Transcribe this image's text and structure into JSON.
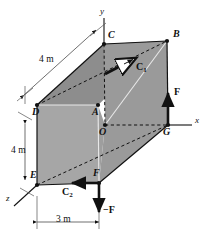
{
  "figure": {
    "type": "statics-free-body-diagram",
    "background_color": "#ffffff",
    "face_fill_front": "#9b9b9b",
    "face_fill_left": "#a8a8a8",
    "face_fill_top": "#8f8f8f",
    "line_color": "#111111"
  },
  "axes": [
    {
      "name": "y-axis",
      "label": "y",
      "x": 101,
      "y": 11
    },
    {
      "name": "x-axis",
      "label": "x",
      "x": 196,
      "y": 119
    },
    {
      "name": "z-axis",
      "label": "z",
      "x": 8,
      "y": 195
    }
  ],
  "vertices": [
    {
      "name": "C",
      "label": "C",
      "px": 104,
      "py": 44,
      "lx": 109,
      "ly": 33
    },
    {
      "name": "B",
      "label": "B",
      "px": 167,
      "py": 41,
      "lx": 174,
      "ly": 33
    },
    {
      "name": "D",
      "label": "D",
      "px": 37,
      "py": 105,
      "lx": 33,
      "ly": 109
    },
    {
      "name": "A",
      "label": "A",
      "px": 98,
      "py": 105,
      "lx": 94,
      "ly": 109
    },
    {
      "name": "O",
      "label": "O",
      "px": 105,
      "py": 125,
      "lx": 100,
      "ly": 129
    },
    {
      "name": "G",
      "label": "G",
      "px": 168,
      "py": 125,
      "lx": 164,
      "ly": 129
    },
    {
      "name": "E",
      "label": "E",
      "px": 37,
      "py": 185,
      "lx": 31,
      "ly": 173
    },
    {
      "name": "F",
      "label": "F",
      "px": 99,
      "py": 183,
      "lx": 95,
      "ly": 171
    }
  ],
  "dimensions": [
    {
      "name": "depth-dimension",
      "label": "4 m",
      "lx": 41,
      "ly": 57
    },
    {
      "name": "height-dimension",
      "label": "4 m",
      "lx": 14,
      "ly": 150
    },
    {
      "name": "width-dimension",
      "label": "3 m",
      "lx": 59,
      "ly": 217
    }
  ],
  "vectors": [
    {
      "name": "couple-C1",
      "label": "C",
      "sub": "1",
      "lx": 138,
      "ly": 64
    },
    {
      "name": "couple-C2",
      "label": "C",
      "sub": "2",
      "lx": 63,
      "ly": 188
    },
    {
      "name": "force-F-up",
      "label": "F",
      "sub": "",
      "lx": 175,
      "ly": 89
    },
    {
      "name": "force-F-down",
      "label": "−F",
      "sub": "",
      "lx": 104,
      "ly": 208
    }
  ]
}
